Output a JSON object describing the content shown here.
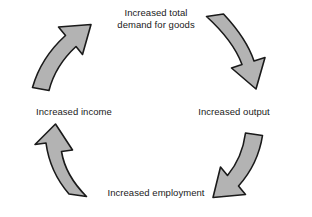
{
  "diagram": {
    "type": "circular-flow",
    "direction": "clockwise",
    "background_color": "#ffffff",
    "arrow_fill_color": "#b3b3b3",
    "arrow_stroke_color": "#1a1a1a",
    "text_color": "#1a1a1a",
    "nodes": [
      {
        "id": "demand",
        "position": "top",
        "lines": [
          "Increased total",
          "demand for goods"
        ]
      },
      {
        "id": "output",
        "position": "right",
        "label": "Increased output"
      },
      {
        "id": "employment",
        "position": "bottom",
        "label": "Increased employment"
      },
      {
        "id": "income",
        "position": "left",
        "label": "Increased income"
      }
    ],
    "arrows": [
      {
        "id": "demand-to-output",
        "from": "demand",
        "to": "output",
        "quadrant": "top-right"
      },
      {
        "id": "output-to-employment",
        "from": "output",
        "to": "employment",
        "quadrant": "bottom-right"
      },
      {
        "id": "employment-to-income",
        "from": "employment",
        "to": "income",
        "quadrant": "bottom-left"
      },
      {
        "id": "income-to-demand",
        "from": "income",
        "to": "demand",
        "quadrant": "top-left"
      }
    ]
  }
}
